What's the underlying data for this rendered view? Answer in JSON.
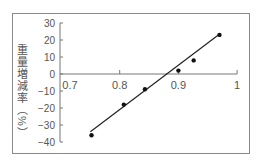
{
  "chart_data": {
    "type": "scatter",
    "title": "",
    "xlabel": "",
    "ylabel": "重量増減率（%）",
    "xlim": [
      0.7,
      1.0
    ],
    "ylim": [
      -40,
      30
    ],
    "x_ticks": [
      "0.7",
      "0.8",
      "0.9",
      "1"
    ],
    "y_ticks": [
      "30",
      "20",
      "10",
      "0",
      "−10",
      "−20",
      "−30",
      "−40"
    ],
    "grid": false,
    "legend": null,
    "series": [
      {
        "name": "data",
        "x": [
          0.752,
          0.807,
          0.843,
          0.9,
          0.926,
          0.97
        ],
        "y": [
          -36,
          -18,
          -9,
          2,
          8,
          23
        ]
      }
    ],
    "fit_line": {
      "type": "linear",
      "x": [
        0.75,
        0.968
      ],
      "y": [
        -34,
        23
      ]
    },
    "colors": {
      "axis": "#777777",
      "points": "#111111",
      "line": "#222222",
      "frame": "#8a8a8a"
    }
  }
}
